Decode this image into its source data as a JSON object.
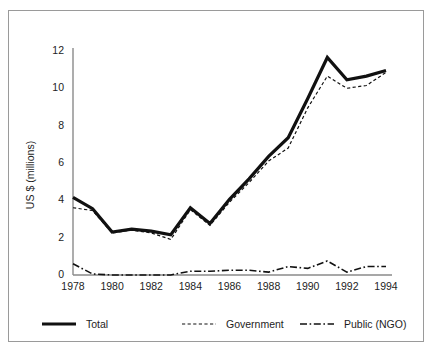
{
  "figure": {
    "border_color": "#9a9a9a",
    "background": "#ffffff",
    "ink_color": "#1a1a1a",
    "axis_color": "#8a8a8a"
  },
  "chart_data": {
    "type": "line",
    "title": "",
    "subtitle": "",
    "xlabel": "",
    "ylabel": "US $ (millions)",
    "xlim": [
      1978,
      1994
    ],
    "ylim": [
      0,
      12
    ],
    "grid": false,
    "legend_position": "bottom",
    "x": [
      1978,
      1979,
      1980,
      1981,
      1982,
      1983,
      1984,
      1985,
      1986,
      1987,
      1988,
      1989,
      1990,
      1991,
      1992,
      1993,
      1994
    ],
    "xticks": [
      "1978",
      "1980",
      "1982",
      "1984",
      "1986",
      "1988",
      "1990",
      "1992",
      "1994"
    ],
    "xtick_values": [
      1978,
      1980,
      1982,
      1984,
      1986,
      1988,
      1990,
      1992,
      1994
    ],
    "yticks": [
      "0",
      "2",
      "4",
      "6",
      "8",
      "10",
      "12"
    ],
    "ytick_values": [
      0,
      2,
      4,
      6,
      8,
      10,
      12
    ],
    "series": [
      {
        "name": "Total",
        "style": "solid",
        "width": 3.2,
        "color": "#111111",
        "values": [
          4.1,
          3.5,
          2.25,
          2.4,
          2.3,
          2.1,
          3.55,
          2.7,
          4.0,
          5.1,
          6.3,
          7.3,
          9.4,
          11.6,
          10.4,
          10.6,
          10.9
        ]
      },
      {
        "name": "Government",
        "style": "dashed",
        "width": 1.2,
        "color": "#111111",
        "values": [
          3.55,
          3.4,
          2.2,
          2.35,
          2.2,
          1.85,
          3.45,
          2.6,
          3.85,
          4.9,
          6.05,
          6.75,
          8.9,
          10.6,
          9.95,
          10.1,
          10.8
        ]
      },
      {
        "name": "Public (NGO)",
        "style": "dashdot",
        "width": 1.6,
        "color": "#111111",
        "values": [
          0.55,
          0.0,
          -0.05,
          -0.05,
          -0.05,
          -0.05,
          0.15,
          0.15,
          0.2,
          0.2,
          0.1,
          0.4,
          0.3,
          0.7,
          0.1,
          0.4,
          0.4
        ]
      }
    ]
  },
  "legend": {
    "items": [
      {
        "label": "Total",
        "style": "solid"
      },
      {
        "label": "Government",
        "style": "dashed"
      },
      {
        "label": "Public (NGO)",
        "style": "dashdot"
      }
    ]
  }
}
